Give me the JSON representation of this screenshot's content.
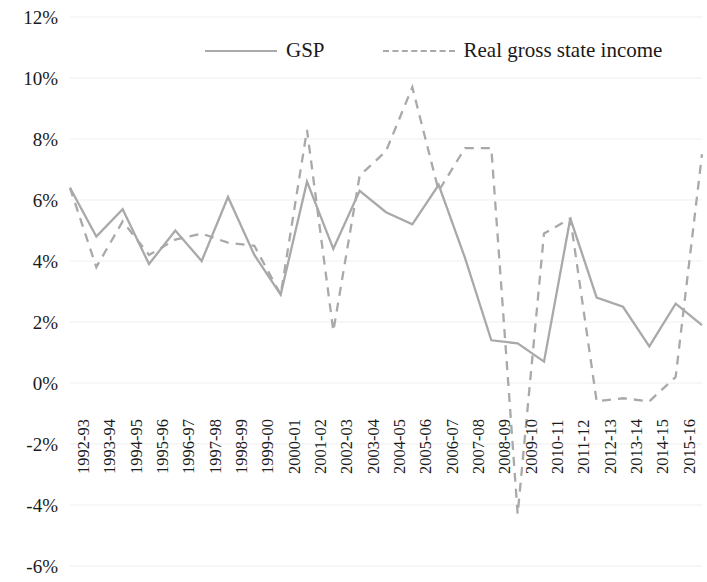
{
  "chart_data": {
    "type": "line",
    "title": "",
    "subtitle": "",
    "xlabel": "",
    "ylabel": "",
    "grid": true,
    "legend_position": "top",
    "ylim": [
      -6,
      12
    ],
    "ytick_step": 2,
    "ytick_labels": [
      "12%",
      "10%",
      "8%",
      "6%",
      "4%",
      "2%",
      "0%",
      "-2%",
      "-4%",
      "-6%"
    ],
    "ytick_values": [
      12,
      10,
      8,
      6,
      4,
      2,
      0,
      -2,
      -4,
      -6
    ],
    "categories": [
      "1992-93",
      "1993-94",
      "1994-95",
      "1995-96",
      "1996-97",
      "1997-98",
      "1998-99",
      "1999-00",
      "2000-01",
      "2001-02",
      "2002-03",
      "2003-04",
      "2004-05",
      "2005-06",
      "2006-07",
      "2007-08",
      "2008-09",
      "2009-10",
      "2010-11",
      "2011-12",
      "2012-13",
      "2013-14",
      "2014-15",
      "2015-16",
      "2016-17"
    ],
    "series": [
      {
        "name": "GSP",
        "style": "solid",
        "color": "#a9a9a9",
        "values": [
          6.4,
          4.8,
          5.7,
          3.9,
          5.0,
          4.0,
          6.1,
          4.2,
          2.9,
          6.6,
          4.4,
          6.3,
          5.6,
          5.2,
          6.5,
          4.1,
          1.4,
          1.3,
          0.7,
          5.4,
          2.8,
          2.5,
          1.2,
          2.6,
          1.9
        ]
      },
      {
        "name": "Real gross state income",
        "style": "dashed",
        "color": "#a9a9a9",
        "values": [
          6.4,
          3.8,
          5.3,
          4.2,
          4.7,
          4.9,
          4.6,
          4.5,
          2.9,
          8.3,
          1.7,
          6.8,
          7.6,
          9.7,
          6.3,
          7.7,
          7.7,
          -4.3,
          4.9,
          5.4,
          -0.6,
          -0.5,
          -0.6,
          0.2,
          7.5
        ]
      }
    ]
  },
  "legend": {
    "items": [
      {
        "label": "GSP",
        "style": "solid"
      },
      {
        "label": "Real gross state income",
        "style": "dashed"
      }
    ]
  }
}
